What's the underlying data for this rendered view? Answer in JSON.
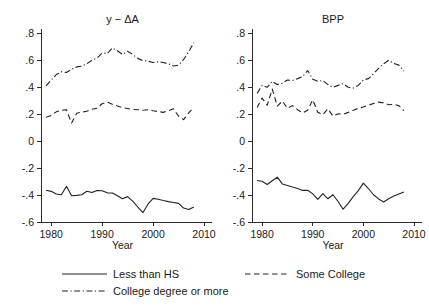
{
  "figure": {
    "xlabel": "Year",
    "legend": {
      "entries": [
        {
          "label": "Less than HS",
          "style": "solid"
        },
        {
          "label": "Some College",
          "style": "dashed"
        },
        {
          "label": "College degree or more",
          "style": "dashdot"
        }
      ]
    }
  },
  "chart_data": [
    {
      "type": "line",
      "title": "y − ΔA",
      "xlabel": "Year",
      "ylabel": "",
      "xlim": [
        1978,
        2010
      ],
      "ylim": [
        -0.6,
        0.8
      ],
      "xticks": [
        1980,
        1990,
        2000,
        2010
      ],
      "xticklabels": [
        "1980",
        "1990",
        "2000",
        "2010"
      ],
      "yticks": [
        -0.6,
        -0.4,
        -0.2,
        0,
        0.2,
        0.4,
        0.6,
        0.8
      ],
      "yticklabels": [
        "-.6",
        "-.4",
        "-.2",
        "0",
        ".2",
        ".4",
        ".6",
        ".8"
      ],
      "grid": false,
      "legend_position": "below-figure",
      "x": [
        1979,
        1980,
        1981,
        1982,
        1983,
        1984,
        1985,
        1986,
        1987,
        1988,
        1989,
        1990,
        1991,
        1992,
        1993,
        1994,
        1995,
        1996,
        1997,
        1998,
        1999,
        2000,
        2001,
        2002,
        2003,
        2004,
        2005,
        2006,
        2007,
        2008
      ],
      "series": [
        {
          "name": "Less than HS",
          "style": "solid",
          "values": [
            -0.365,
            -0.373,
            -0.392,
            -0.398,
            -0.335,
            -0.405,
            -0.403,
            -0.398,
            -0.372,
            -0.382,
            -0.367,
            -0.369,
            -0.384,
            -0.385,
            -0.406,
            -0.428,
            -0.412,
            -0.445,
            -0.489,
            -0.531,
            -0.468,
            -0.425,
            -0.432,
            -0.441,
            -0.449,
            -0.455,
            -0.462,
            -0.497,
            -0.507,
            -0.489
          ]
        },
        {
          "name": "Some College",
          "style": "dashed",
          "values": [
            0.176,
            0.189,
            0.216,
            0.228,
            0.231,
            0.133,
            0.205,
            0.214,
            0.221,
            0.235,
            0.243,
            0.276,
            0.289,
            0.272,
            0.259,
            0.248,
            0.241,
            0.234,
            0.232,
            0.228,
            0.231,
            0.224,
            0.218,
            0.212,
            0.225,
            0.239,
            0.185,
            0.158,
            0.208,
            0.251
          ]
        },
        {
          "name": "College degree or more",
          "style": "dashdot",
          "values": [
            0.408,
            0.452,
            0.492,
            0.513,
            0.508,
            0.531,
            0.549,
            0.554,
            0.572,
            0.598,
            0.615,
            0.651,
            0.648,
            0.689,
            0.668,
            0.641,
            0.665,
            0.641,
            0.612,
            0.596,
            0.591,
            0.582,
            0.587,
            0.581,
            0.572,
            0.556,
            0.562,
            0.604,
            0.661,
            0.728
          ]
        }
      ]
    },
    {
      "type": "line",
      "title": "BPP",
      "xlabel": "Year",
      "ylabel": "",
      "xlim": [
        1978,
        2010
      ],
      "ylim": [
        -0.6,
        0.8
      ],
      "xticks": [
        1980,
        1990,
        2000,
        2010
      ],
      "xticklabels": [
        "1980",
        "1990",
        "2000",
        "2010"
      ],
      "yticks": [
        -0.6,
        -0.4,
        -0.2,
        0,
        0.2,
        0.4,
        0.6,
        0.8
      ],
      "yticklabels": [
        "-.6",
        "-.4",
        "-.2",
        "0",
        ".2",
        ".4",
        ".6",
        ".8"
      ],
      "grid": false,
      "legend_position": "below-figure",
      "x": [
        1979,
        1980,
        1981,
        1982,
        1983,
        1984,
        1985,
        1986,
        1987,
        1988,
        1989,
        1990,
        1991,
        1992,
        1993,
        1994,
        1995,
        1996,
        1997,
        1998,
        1999,
        2000,
        2001,
        2002,
        2003,
        2004,
        2005,
        2006,
        2007,
        2008
      ],
      "series": [
        {
          "name": "Less than HS",
          "style": "solid",
          "values": [
            -0.292,
            -0.298,
            -0.322,
            -0.295,
            -0.268,
            -0.318,
            -0.329,
            -0.341,
            -0.352,
            -0.366,
            -0.365,
            -0.392,
            -0.432,
            -0.389,
            -0.428,
            -0.398,
            -0.448,
            -0.505,
            -0.462,
            -0.412,
            -0.368,
            -0.312,
            -0.352,
            -0.398,
            -0.429,
            -0.452,
            -0.428,
            -0.408,
            -0.392,
            -0.378
          ]
        },
        {
          "name": "Some College",
          "style": "dashed",
          "values": [
            0.248,
            0.318,
            0.265,
            0.385,
            0.258,
            0.296,
            0.242,
            0.262,
            0.232,
            0.208,
            0.228,
            0.305,
            0.212,
            0.196,
            0.238,
            0.185,
            0.202,
            0.198,
            0.212,
            0.228,
            0.242,
            0.252,
            0.265,
            0.278,
            0.288,
            0.282,
            0.268,
            0.272,
            0.262,
            0.225
          ]
        },
        {
          "name": "College degree or more",
          "style": "dashdot",
          "values": [
            0.352,
            0.412,
            0.398,
            0.442,
            0.418,
            0.428,
            0.452,
            0.448,
            0.462,
            0.478,
            0.522,
            0.458,
            0.442,
            0.448,
            0.418,
            0.398,
            0.412,
            0.425,
            0.398,
            0.392,
            0.412,
            0.452,
            0.462,
            0.498,
            0.538,
            0.572,
            0.598,
            0.575,
            0.562,
            0.518
          ]
        }
      ]
    }
  ]
}
